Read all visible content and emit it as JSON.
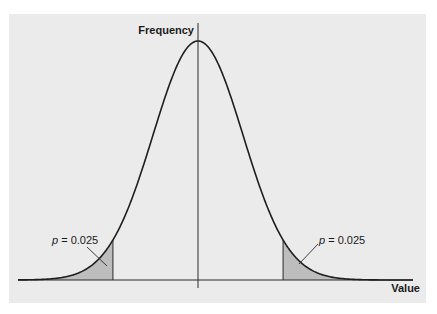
{
  "chart_data": {
    "type": "area",
    "title": "",
    "xlabel": "Value",
    "ylabel": "Frequency",
    "distribution": "normal",
    "mean": 0,
    "sd": 1,
    "grid": false,
    "legend": null,
    "tails": [
      {
        "side": "left",
        "cutoff_z": -1.96,
        "p": 0.025,
        "label": "p = 0.025"
      },
      {
        "side": "right",
        "cutoff_z": 1.96,
        "p": 0.025,
        "label": "p = 0.025"
      }
    ],
    "x_range_z": [
      -4.1,
      4.9
    ],
    "colors": {
      "background": "#ebebeb",
      "curve": "#1e1e1e",
      "tail_fill": "#bdbdbd",
      "axis": "#2a2a2a"
    }
  },
  "labels": {
    "y_axis": "Frequency",
    "x_axis": "Value",
    "left_p_var": "p",
    "left_p_rest": " = 0.025",
    "right_p_var": "p",
    "right_p_rest": " = 0.025"
  }
}
